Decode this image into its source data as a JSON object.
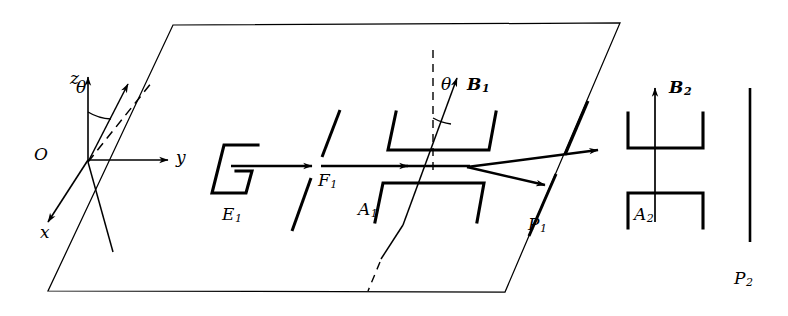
{
  "figure": {
    "line_color": "#000000",
    "background": "#ffffff",
    "width": 788,
    "height": 316
  },
  "axes": {
    "z": {
      "label": "z",
      "x": 70,
      "y": 78,
      "description": "vertical axis with arrowhead pointing up"
    },
    "y": {
      "label": "y",
      "x": 176,
      "y": 155,
      "description": "horizontal axis with arrowhead pointing right"
    },
    "x": {
      "label": "x",
      "x": 44,
      "y": 229,
      "description": "axis with arrowhead pointing down-left"
    },
    "origin": {
      "label": "O",
      "x": 37,
      "y": 153
    }
  },
  "angles": {
    "theta_origin": {
      "label": "θ",
      "x": 76,
      "y": 83
    },
    "theta_field": {
      "label": "θ",
      "x": 441,
      "y": 80
    }
  },
  "components": [
    {
      "name": "E1",
      "base": "E",
      "sub": "1",
      "x": 226,
      "y": 217,
      "role": "electron-source"
    },
    {
      "name": "F1",
      "base": "F",
      "sub": "1",
      "x": 321,
      "y": 183,
      "role": "slit"
    },
    {
      "name": "A1",
      "base": "A",
      "sub": "1",
      "x": 362,
      "y": 212,
      "role": "analyzer-magnet-1"
    },
    {
      "name": "P1",
      "base": "P",
      "sub": "1",
      "x": 531,
      "y": 227,
      "role": "slit"
    },
    {
      "name": "A2",
      "base": "A",
      "sub": "2",
      "x": 619,
      "y": 217,
      "role": "analyzer-magnet-2"
    },
    {
      "name": "P2",
      "base": "P",
      "sub": "2",
      "x": 738,
      "y": 281,
      "role": "detector-screen"
    }
  ],
  "fields": [
    {
      "name": "B1",
      "base": "B",
      "sub": "1",
      "x": 470,
      "y": 81,
      "direction": "tilted by theta from vertical"
    },
    {
      "name": "B2",
      "base": "B",
      "sub": "2",
      "x": 665,
      "y": 84,
      "direction": "vertical"
    }
  ]
}
